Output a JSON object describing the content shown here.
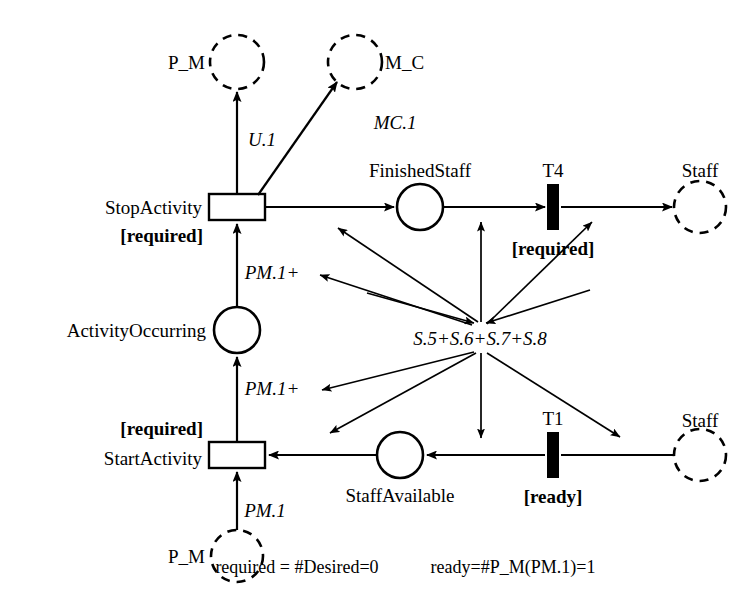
{
  "diagram": {
    "type": "petri-net",
    "title": "",
    "places": [
      {
        "id": "p_m_top",
        "label": "P_M",
        "shape": "dashed-circle",
        "cx": 237,
        "cy": 62,
        "r": 27,
        "label_pos": "left"
      },
      {
        "id": "m_c",
        "label": "M_C",
        "shape": "dashed-circle",
        "cx": 355,
        "cy": 62,
        "r": 27,
        "label_pos": "right"
      },
      {
        "id": "finishedstaff",
        "label": "FinishedStaff",
        "shape": "solid-circle",
        "cx": 420,
        "cy": 207,
        "r": 23,
        "label_pos": "top"
      },
      {
        "id": "staff_top",
        "label": "Staff",
        "shape": "dashed-circle",
        "cx": 700,
        "cy": 207,
        "r": 26,
        "label_pos": "top"
      },
      {
        "id": "activityoccurring",
        "label": "ActivityOccurring",
        "shape": "solid-circle",
        "cx": 237,
        "cy": 330,
        "r": 23,
        "label_pos": "left"
      },
      {
        "id": "staffavailable",
        "label": "StaffAvailable",
        "shape": "solid-circle",
        "cx": 400,
        "cy": 455,
        "r": 23,
        "label_pos": "bottom"
      },
      {
        "id": "staff_bottom",
        "label": "Staff",
        "shape": "dashed-circle",
        "cx": 700,
        "cy": 455,
        "r": 26,
        "label_pos": "top"
      },
      {
        "id": "p_m_bottom",
        "label": "P_M",
        "shape": "dashed-circle",
        "cx": 237,
        "cy": 556,
        "r": 26,
        "label_pos": "left"
      }
    ],
    "transitions": [
      {
        "id": "stopactivity",
        "label": "StopActivity",
        "guard": "[required]",
        "shape": "open-rect",
        "cx": 237,
        "cy": 207,
        "w": 56,
        "h": 26,
        "label_pos": "left",
        "guard_pos": "below-left"
      },
      {
        "id": "t4",
        "label": "T4",
        "guard": "[required]",
        "shape": "filled-bar",
        "cx": 553,
        "cy": 207,
        "w": 12,
        "h": 46,
        "label_pos": "top",
        "guard_pos": "below"
      },
      {
        "id": "startactivity",
        "label": "StartActivity",
        "guard": "[required]",
        "shape": "open-rect",
        "cx": 237,
        "cy": 455,
        "w": 56,
        "h": 26,
        "label_pos": "left",
        "guard_pos": "above-left"
      },
      {
        "id": "t1",
        "label": "T1",
        "guard": "[ready]",
        "shape": "filled-bar",
        "cx": 553,
        "cy": 455,
        "w": 12,
        "h": 46,
        "label_pos": "top",
        "guard_pos": "below"
      }
    ],
    "hub": {
      "id": "s-hub",
      "label": "S.5+S.6+S.7+S.8",
      "cx": 480,
      "cy": 338
    },
    "arc_labels": [
      {
        "id": "u1",
        "text": "U.1",
        "x": 262,
        "y": 139
      },
      {
        "id": "mc1",
        "text": "MC.1",
        "x": 395,
        "y": 122
      },
      {
        "id": "pm1plus_top",
        "text": "PM.1+",
        "x": 272,
        "y": 272
      },
      {
        "id": "pm1plus_bottom",
        "text": "PM.1+",
        "x": 272,
        "y": 388
      },
      {
        "id": "pm1_bottom",
        "text": "PM.1",
        "x": 265,
        "y": 510
      }
    ],
    "legend": [
      {
        "id": "legend-required",
        "text": "required = #Desired=0",
        "x": 297,
        "y": 567
      },
      {
        "id": "legend-ready",
        "text": "ready=#P_M(PM.1)=1",
        "x": 513,
        "y": 567
      }
    ]
  }
}
